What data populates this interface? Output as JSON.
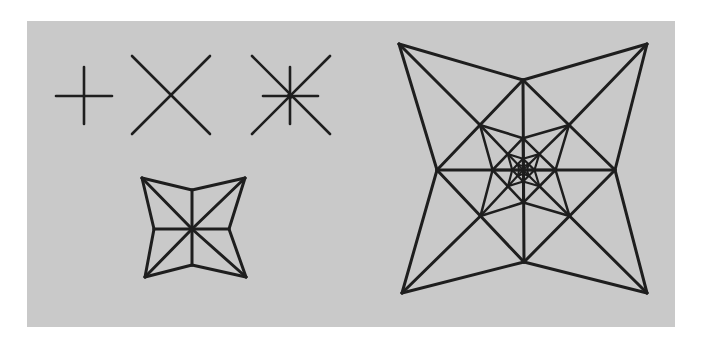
{
  "canvas": {
    "width": 702,
    "height": 342,
    "background": "#ffffff"
  },
  "panel": {
    "x": 27,
    "y": 21,
    "width": 648,
    "height": 306,
    "fill": "#c9c9c9"
  },
  "stroke": {
    "color": "#1e1e1e",
    "small_width": 2.6,
    "star_width": 3.0
  },
  "figures": [
    {
      "name": "plus-figure",
      "type": "spokes",
      "center": [
        84,
        96
      ],
      "segments": [
        [
          56,
          96,
          112,
          96
        ],
        [
          84,
          67,
          84,
          124
        ]
      ]
    },
    {
      "name": "x-figure",
      "type": "spokes",
      "center": [
        171,
        96
      ],
      "segments": [
        [
          132,
          56,
          210,
          134
        ],
        [
          210,
          56,
          132,
          134
        ]
      ]
    },
    {
      "name": "asterisk-figure",
      "type": "spokes",
      "center": [
        290,
        96
      ],
      "segments": [
        [
          252,
          56,
          330,
          134
        ],
        [
          330,
          56,
          252,
          134
        ],
        [
          263,
          96,
          318,
          96
        ],
        [
          290,
          67,
          290,
          124
        ]
      ],
      "center_dot": 3
    },
    {
      "name": "small-star-figure",
      "type": "star",
      "center": [
        192,
        229
      ],
      "outer": [
        [
          142,
          178
        ],
        [
          245,
          178
        ],
        [
          246,
          277
        ],
        [
          145,
          277
        ]
      ],
      "inner": [
        [
          192,
          190
        ],
        [
          229,
          229
        ],
        [
          192,
          265
        ],
        [
          154,
          229
        ]
      ],
      "levels": 1
    },
    {
      "name": "large-star-figure",
      "type": "star",
      "center": [
        523,
        170
      ],
      "outer": [
        [
          399,
          44
        ],
        [
          647,
          44
        ],
        [
          647,
          293
        ],
        [
          402,
          293
        ]
      ],
      "inner": [
        [
          523,
          80
        ],
        [
          615,
          170
        ],
        [
          524,
          262
        ],
        [
          437,
          170
        ]
      ],
      "levels": 4
    }
  ]
}
